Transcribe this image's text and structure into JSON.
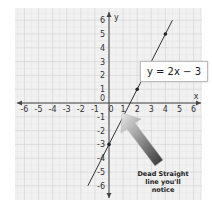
{
  "chart_data": {
    "type": "line",
    "title": "",
    "equation": "y = 2x − 3",
    "xlabel": "x",
    "ylabel": "y",
    "xlim": [
      -6,
      6
    ],
    "ylim": [
      -6,
      6
    ],
    "grid": true,
    "x_ticks": [
      -6,
      -5,
      -4,
      -3,
      -2,
      -1,
      0,
      1,
      2,
      3,
      4,
      5,
      6
    ],
    "y_ticks": [
      -6,
      -5,
      -4,
      -3,
      -2,
      -1,
      0,
      1,
      2,
      3,
      4,
      5,
      6
    ],
    "series": [
      {
        "name": "y = 2x − 3",
        "slope": 2,
        "intercept": -3,
        "x": [
          -1.5,
          4.5
        ],
        "y": [
          -6,
          6
        ]
      }
    ],
    "points": [
      {
        "x": 0,
        "y": -3
      },
      {
        "x": 2,
        "y": 1
      },
      {
        "x": 4,
        "y": 5
      }
    ],
    "annotations": [
      {
        "text": "Dead Straight line you'll notice",
        "arrow_to": {
          "x": 1,
          "y": -1
        }
      }
    ]
  },
  "labels": {
    "equation": "y = 2x − 3",
    "note_line1": "Dead Straight",
    "note_line2": "line you'll",
    "note_line3": "notice",
    "x_axis": "x",
    "y_axis": "y"
  }
}
